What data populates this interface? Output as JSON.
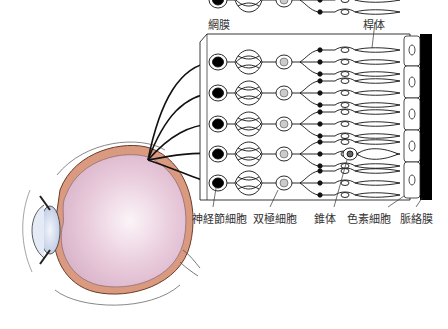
{
  "diagram": {
    "labels": {
      "retina": "網膜",
      "rod": "桿体",
      "ganglion_cell": "神経節細胞",
      "bipolar_cell": "双極細胞",
      "cone": "錐体",
      "pigment_cell": "色素細胞",
      "choroid": "脈絡膜"
    },
    "colors": {
      "vitreous": "#e6c6d6",
      "choroid_layer": "#d99a80",
      "lens": "#d6dff0",
      "choroid_band": "#000000",
      "line": "#111111"
    },
    "rows": 5
  }
}
